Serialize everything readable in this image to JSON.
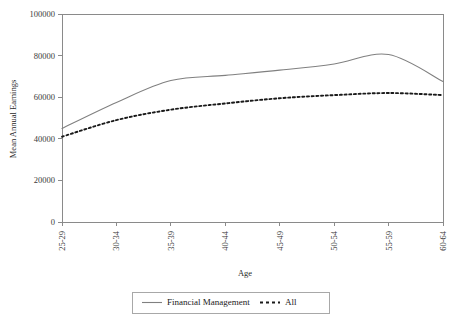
{
  "chart_data": {
    "type": "line",
    "title": "",
    "xlabel": "Age",
    "ylabel": "Mean Annual Earnings",
    "categories": [
      "25-29",
      "30-34",
      "35-39",
      "40-44",
      "45-49",
      "50-54",
      "55-59",
      "60-64"
    ],
    "ylim": [
      0,
      100000
    ],
    "yticks": [
      0,
      20000,
      40000,
      60000,
      80000,
      100000
    ],
    "ytick_labels": [
      "0",
      "20000",
      "40000",
      "60000",
      "80000",
      "100000"
    ],
    "grid": false,
    "legend_position": "bottom",
    "series": [
      {
        "name": "Financial Management",
        "style": "solid",
        "color": "#808080",
        "values": [
          45000,
          57500,
          68000,
          70500,
          73000,
          76000,
          80500,
          67500
        ]
      },
      {
        "name": "All",
        "style": "dashed",
        "color": "#1a1a1a",
        "values": [
          41000,
          49000,
          54000,
          57000,
          59500,
          61000,
          62000,
          61000
        ]
      }
    ]
  },
  "legend": {
    "entries": [
      {
        "label": "Financial Management"
      },
      {
        "label": "All"
      }
    ]
  },
  "axes": {
    "x_title": "Age",
    "y_title": "Mean Annual Earnings"
  }
}
